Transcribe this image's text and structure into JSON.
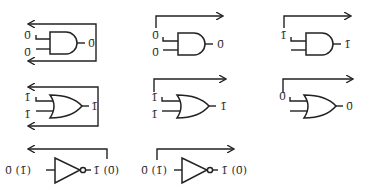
{
  "diagram": {
    "title": "",
    "gates": [
      {
        "id": "and-feedback",
        "type": "AND",
        "inputs": [
          "0̄",
          "0̄"
        ],
        "output": "0̄",
        "arrow": "feedback-both"
      },
      {
        "id": "and-forward-0",
        "type": "AND",
        "inputs": [
          "0̄",
          "0̄"
        ],
        "output": "0̄",
        "arrow": "forward",
        "arrow_label": "0̄"
      },
      {
        "id": "and-forward-1",
        "type": "AND",
        "inputs": [
          "",
          ""
        ],
        "output": "1̄",
        "arrow": "forward",
        "arrow_label": "1̄"
      },
      {
        "id": "or-feedback",
        "type": "OR",
        "inputs": [
          "1̄",
          "1̄"
        ],
        "output": "1̄",
        "arrow": "feedback-both"
      },
      {
        "id": "or-forward-1",
        "type": "OR",
        "inputs": [
          "1̄",
          "1̄"
        ],
        "output": "1̄",
        "arrow": "forward",
        "arrow_label": "1̄"
      },
      {
        "id": "or-forward-0",
        "type": "OR",
        "inputs": [
          "",
          ""
        ],
        "output": "0̄",
        "arrow": "forward",
        "arrow_label": "0̄"
      },
      {
        "id": "not-feedback",
        "type": "NOT",
        "input": "0̄ (1̄)",
        "output": "1̄ (0̄)",
        "arrow": "feedback"
      },
      {
        "id": "not-forward",
        "type": "NOT",
        "input": "0̄ (1̄)",
        "output": "1̄ (0̄)",
        "arrow": "forward"
      }
    ]
  },
  "labels": {
    "g1_in1": "0̄",
    "g1_in2": "0̄",
    "g1_out": "0̄",
    "g2_in1": "0̄",
    "g2_in2": "0̄",
    "g2_out": "0̄",
    "g3_in1": "1̄",
    "g3_out": "1̄",
    "g4_in1": "1̄",
    "g4_in2": "1̄",
    "g4_out": "1̄",
    "g5_in1": "1̄",
    "g5_in2": "1̄",
    "g5_out": "1̄",
    "g6_in1": "0̄",
    "g6_out": "0̄",
    "g7_in": "0̄ (1̄)",
    "g7_out": "1̄ (0̄)",
    "g8_in": "0̄ (1̄)",
    "g8_out": "1̄ (0̄)"
  }
}
